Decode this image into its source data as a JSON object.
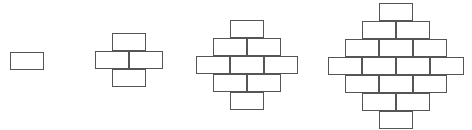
{
  "canvas": {
    "width": 472,
    "height": 130,
    "background": "#ffffff"
  },
  "style": {
    "brick_fill": "#ffffff",
    "brick_stroke": "#555555",
    "brick_stroke_width": 1,
    "brick_width": 34,
    "brick_height": 18
  },
  "chart_data": {
    "type": "diagram",
    "title": "",
    "figures": [
      {
        "index": 1,
        "label": "",
        "row_counts": [
          1
        ],
        "row_count": 1,
        "brick_total": 1,
        "origin_x": 10,
        "origin_y": 52,
        "center_x": 27,
        "bricks": [
          {
            "row": 0,
            "col": 0,
            "x": 10,
            "y": 52,
            "w": 34,
            "h": 18
          }
        ]
      },
      {
        "index": 2,
        "label": "",
        "row_counts": [
          1,
          2,
          1
        ],
        "row_count": 3,
        "brick_total": 4,
        "origin_x": 95,
        "origin_y": 33,
        "center_x": 129,
        "bricks": [
          {
            "row": 0,
            "col": 0,
            "x": 112,
            "y": 33,
            "w": 34,
            "h": 18
          },
          {
            "row": 1,
            "col": 0,
            "x": 95,
            "y": 51,
            "w": 34,
            "h": 18
          },
          {
            "row": 1,
            "col": 1,
            "x": 129,
            "y": 51,
            "w": 34,
            "h": 18
          },
          {
            "row": 2,
            "col": 0,
            "x": 112,
            "y": 69,
            "w": 34,
            "h": 18
          }
        ]
      },
      {
        "index": 3,
        "label": "",
        "row_counts": [
          1,
          2,
          3,
          2,
          1
        ],
        "row_count": 5,
        "brick_total": 9,
        "origin_x": 196,
        "origin_y": 20,
        "center_x": 247,
        "bricks": [
          {
            "row": 0,
            "col": 0,
            "x": 230,
            "y": 20,
            "w": 34,
            "h": 18
          },
          {
            "row": 1,
            "col": 0,
            "x": 213,
            "y": 38,
            "w": 34,
            "h": 18
          },
          {
            "row": 1,
            "col": 1,
            "x": 247,
            "y": 38,
            "w": 34,
            "h": 18
          },
          {
            "row": 2,
            "col": 0,
            "x": 196,
            "y": 56,
            "w": 34,
            "h": 18
          },
          {
            "row": 2,
            "col": 1,
            "x": 230,
            "y": 56,
            "w": 34,
            "h": 18
          },
          {
            "row": 2,
            "col": 2,
            "x": 264,
            "y": 56,
            "w": 34,
            "h": 18
          },
          {
            "row": 3,
            "col": 0,
            "x": 213,
            "y": 74,
            "w": 34,
            "h": 18
          },
          {
            "row": 3,
            "col": 1,
            "x": 247,
            "y": 74,
            "w": 34,
            "h": 18
          },
          {
            "row": 4,
            "col": 0,
            "x": 230,
            "y": 92,
            "w": 34,
            "h": 18
          }
        ]
      },
      {
        "index": 4,
        "label": "",
        "row_counts": [
          1,
          2,
          3,
          4,
          3,
          2,
          1
        ],
        "row_count": 7,
        "brick_total": 16,
        "origin_x": 328,
        "origin_y": 3,
        "center_x": 396,
        "bricks": [
          {
            "row": 0,
            "col": 0,
            "x": 379,
            "y": 3,
            "w": 34,
            "h": 18
          },
          {
            "row": 1,
            "col": 0,
            "x": 362,
            "y": 21,
            "w": 34,
            "h": 18
          },
          {
            "row": 1,
            "col": 1,
            "x": 396,
            "y": 21,
            "w": 34,
            "h": 18
          },
          {
            "row": 2,
            "col": 0,
            "x": 345,
            "y": 39,
            "w": 34,
            "h": 18
          },
          {
            "row": 2,
            "col": 1,
            "x": 379,
            "y": 39,
            "w": 34,
            "h": 18
          },
          {
            "row": 2,
            "col": 2,
            "x": 413,
            "y": 39,
            "w": 34,
            "h": 18
          },
          {
            "row": 3,
            "col": 0,
            "x": 328,
            "y": 57,
            "w": 34,
            "h": 18
          },
          {
            "row": 3,
            "col": 1,
            "x": 362,
            "y": 57,
            "w": 34,
            "h": 18
          },
          {
            "row": 3,
            "col": 2,
            "x": 396,
            "y": 57,
            "w": 34,
            "h": 18
          },
          {
            "row": 3,
            "col": 3,
            "x": 430,
            "y": 57,
            "w": 34,
            "h": 18
          },
          {
            "row": 4,
            "col": 0,
            "x": 345,
            "y": 75,
            "w": 34,
            "h": 18
          },
          {
            "row": 4,
            "col": 1,
            "x": 379,
            "y": 75,
            "w": 34,
            "h": 18
          },
          {
            "row": 4,
            "col": 2,
            "x": 413,
            "y": 75,
            "w": 34,
            "h": 18
          },
          {
            "row": 5,
            "col": 0,
            "x": 362,
            "y": 93,
            "w": 34,
            "h": 18
          },
          {
            "row": 5,
            "col": 1,
            "x": 396,
            "y": 93,
            "w": 34,
            "h": 18
          },
          {
            "row": 6,
            "col": 0,
            "x": 379,
            "y": 111,
            "w": 34,
            "h": 18
          }
        ]
      }
    ]
  }
}
